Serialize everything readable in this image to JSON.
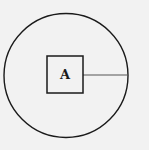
{
  "diagram": {
    "background": "#f2f2f2",
    "stroke_color": "#1a1a1a",
    "circle": {
      "cx": 66,
      "cy": 75.5,
      "r": 62
    },
    "box": {
      "x": 47,
      "y": 56,
      "width": 36,
      "height": 37,
      "label": "A"
    },
    "radius_line": {
      "x1": 83,
      "y1": 75,
      "x2": 128,
      "y2": 75,
      "color": "#555555"
    }
  }
}
